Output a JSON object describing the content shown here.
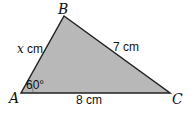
{
  "diagram": {
    "type": "triangle",
    "fill_color": "#b8b8b8",
    "stroke_color": "#222222",
    "vertices": {
      "A": {
        "label": "A"
      },
      "B": {
        "label": "B"
      },
      "C": {
        "label": "C"
      }
    },
    "sides": {
      "AB": {
        "variable": "x",
        "unit": " cm"
      },
      "BC": {
        "label": "7 cm"
      },
      "AC": {
        "label": "8 cm"
      }
    },
    "angles": {
      "A": {
        "label": "60°"
      }
    }
  }
}
